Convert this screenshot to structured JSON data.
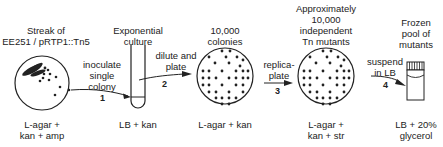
{
  "diagram": {
    "stages": [
      {
        "id": "streak-plate",
        "title_lines": [
          "Streak of",
          "EE251 / pRTP1::Tn5"
        ],
        "medium_lines": [
          "L-agar +",
          "kan + amp"
        ]
      },
      {
        "id": "culture-tube",
        "title_lines": [
          "Exponential",
          "culture"
        ],
        "medium_lines": [
          "LB + kan"
        ]
      },
      {
        "id": "colony-plate",
        "title_lines": [
          "10,000",
          "colonies"
        ],
        "medium_lines": [
          "L-agar + kan"
        ]
      },
      {
        "id": "mutant-plate",
        "title_lines": [
          "Approximately",
          "10,000",
          "independent",
          "Tn mutants"
        ],
        "medium_lines": [
          "L-agar +",
          "kan + str"
        ]
      },
      {
        "id": "frozen-vial",
        "title_lines": [
          "Frozen",
          "pool of",
          "mutants"
        ],
        "medium_lines": [
          "LB + 20%",
          "glycerol"
        ]
      }
    ],
    "steps": [
      {
        "number": "1",
        "lines": [
          "inoculate",
          "single",
          "colony"
        ]
      },
      {
        "number": "2",
        "lines": [
          "dilute and",
          "plate"
        ]
      },
      {
        "number": "3",
        "lines": [
          "replica-",
          "plate"
        ]
      },
      {
        "number": "4",
        "lines": [
          "suspend",
          "in LB"
        ]
      }
    ],
    "colors": {
      "ink": "#222222",
      "background": "#ffffff"
    }
  }
}
